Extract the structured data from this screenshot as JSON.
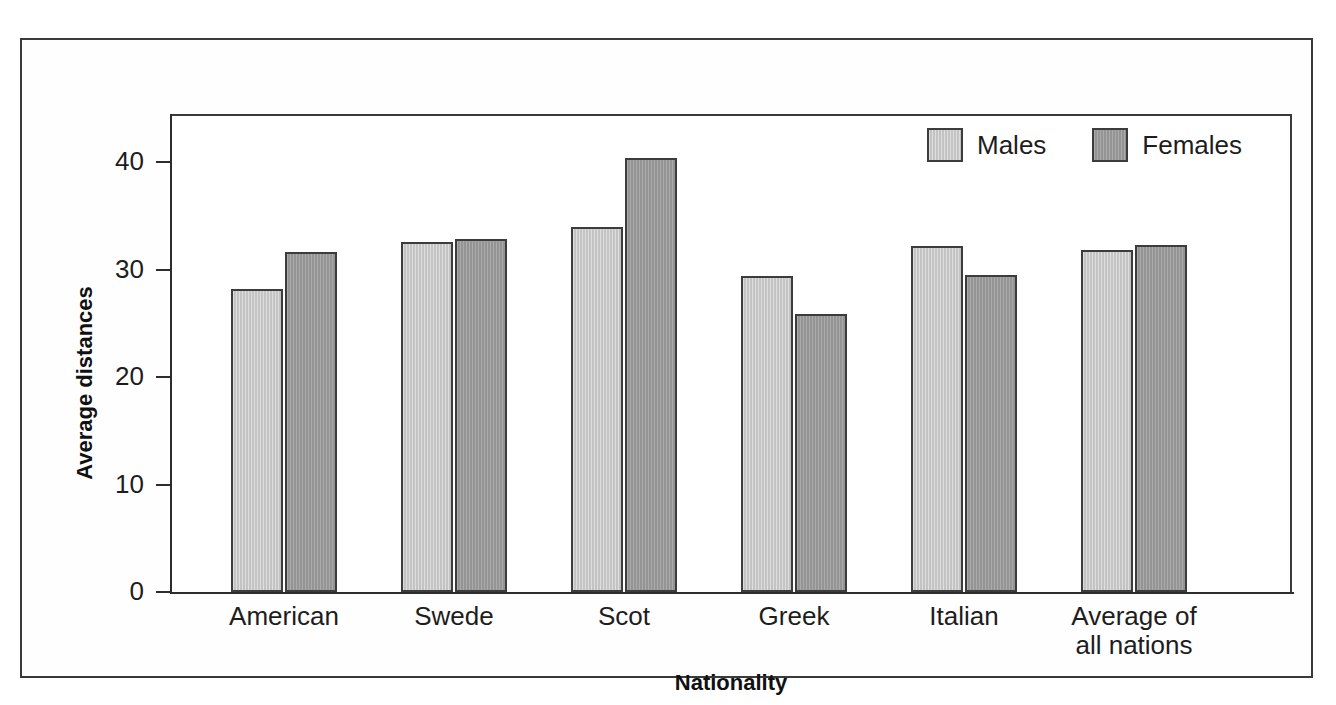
{
  "chart_data": {
    "type": "bar",
    "title": "",
    "xlabel": "Nationality",
    "ylabel": "Average distances",
    "categories": [
      "American",
      "Swede",
      "Scot",
      "Greek",
      "Italian",
      "Average of all nations"
    ],
    "category_lines": [
      [
        "American"
      ],
      [
        "Swede"
      ],
      [
        "Scot"
      ],
      [
        "Greek"
      ],
      [
        "Italian"
      ],
      [
        "Average of",
        "all nations"
      ]
    ],
    "series": [
      {
        "name": "Males",
        "color": "#c3c3c3",
        "values": [
          28.2,
          32.6,
          34.0,
          29.4,
          32.2,
          31.8
        ]
      },
      {
        "name": "Females",
        "color": "#949494",
        "values": [
          31.7,
          32.9,
          40.4,
          25.9,
          29.5,
          32.3
        ]
      }
    ],
    "ylim": [
      0,
      44.5
    ],
    "yticks": [
      0,
      10,
      20,
      30,
      40
    ],
    "ytick_labels": [
      "0",
      "10",
      "20",
      "30",
      "40"
    ],
    "grid": false,
    "legend_position": "top-right",
    "legend_entries": [
      "Males",
      "Females"
    ]
  },
  "figure": {
    "frame_color": "#3a3a3a",
    "axis_color": "#2d2d2d",
    "background": "#ffffff"
  }
}
